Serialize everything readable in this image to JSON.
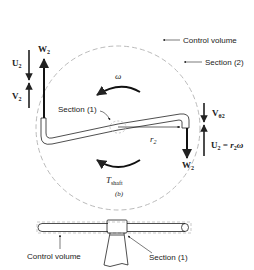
{
  "figure": {
    "panel_label": "(b)",
    "top_view": {
      "labels": {
        "control_volume": "Control volume",
        "section_2": "Section (2)",
        "section_1": "Section (1)",
        "omega": "ω",
        "r2": "r",
        "r2_sub": "2",
        "torque": "T",
        "torque_sub": "shaft"
      },
      "left_vectors": {
        "W2": "W",
        "W2_sub": "2",
        "U2": "U",
        "U2_sub": "2",
        "V2": "V",
        "V2_sub": "2"
      },
      "right_vectors": {
        "Vtheta2": "V",
        "Vtheta2_sub": "θ2",
        "U2_eq": "U",
        "U2_eq_sub": "2",
        "U2_eq_rhs": " = r",
        "U2_eq_rhs_sub": "2",
        "U2_eq_rhs_tail": "ω",
        "W2": "W",
        "W2_sub": "2"
      }
    },
    "side_view": {
      "labels": {
        "control_volume": "Control volume",
        "section_1": "Section (1)"
      }
    },
    "colors": {
      "line": "#222222",
      "dashed": "#b8b8b8"
    }
  }
}
